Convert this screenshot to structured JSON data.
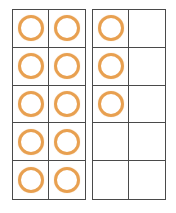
{
  "diagram": {
    "type": "ten-frames",
    "counter_color": "#e8a050",
    "line_color": "#4a4a4a",
    "total_count": 13,
    "frames": [
      {
        "name": "left-ten-frame",
        "rows": 5,
        "columns": 2,
        "filled_count": 10,
        "cells": [
          true,
          true,
          true,
          true,
          true,
          true,
          true,
          true,
          true,
          true
        ]
      },
      {
        "name": "right-ten-frame",
        "rows": 5,
        "columns": 2,
        "filled_count": 3,
        "cells": [
          true,
          false,
          true,
          false,
          true,
          false,
          false,
          false,
          false,
          false
        ]
      }
    ]
  }
}
